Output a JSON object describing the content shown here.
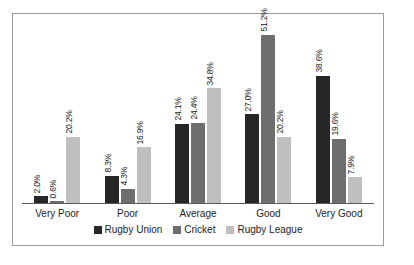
{
  "chart_data": {
    "type": "bar",
    "title": "",
    "subtitle": "",
    "xlabel": "",
    "ylabel": "",
    "ylim": [
      0,
      55
    ],
    "grid": false,
    "legend_position": "bottom",
    "value_label_suffix": "%",
    "value_labels_rotated": true,
    "categories": [
      "Very Poor",
      "Poor",
      "Average",
      "Good",
      "Very Good"
    ],
    "series": [
      {
        "name": "Rugby Union",
        "color": "#262626",
        "values": [
          2.0,
          8.3,
          24.1,
          27.0,
          38.6
        ],
        "labels": [
          "2.0%",
          "8.3%",
          "24.1%",
          "27.0%",
          "38.6%"
        ]
      },
      {
        "name": "Cricket",
        "color": "#6e6e6e",
        "values": [
          0.6,
          4.3,
          24.4,
          51.2,
          19.6
        ],
        "labels": [
          "0.6%",
          "4.3%",
          "24.4%",
          "51.2%",
          "19.6%"
        ]
      },
      {
        "name": "Rugby League",
        "color": "#bfbfbf",
        "values": [
          20.2,
          16.9,
          34.8,
          20.2,
          7.9
        ],
        "labels": [
          "20.2%",
          "16.9%",
          "34.8%",
          "20.2%",
          "7.9%"
        ]
      }
    ]
  },
  "legend": {
    "items": [
      {
        "label": "Rugby Union",
        "color": "#262626",
        "swatch_name": "legend-swatch-rugby-union"
      },
      {
        "label": "Cricket",
        "color": "#6e6e6e",
        "swatch_name": "legend-swatch-cricket"
      },
      {
        "label": "Rugby League",
        "color": "#bfbfbf",
        "swatch_name": "legend-swatch-rugby-league"
      }
    ]
  },
  "frame": {
    "border_color": "#9a9a9a",
    "axis_color": "#5a5a5a",
    "background": "#ffffff"
  }
}
